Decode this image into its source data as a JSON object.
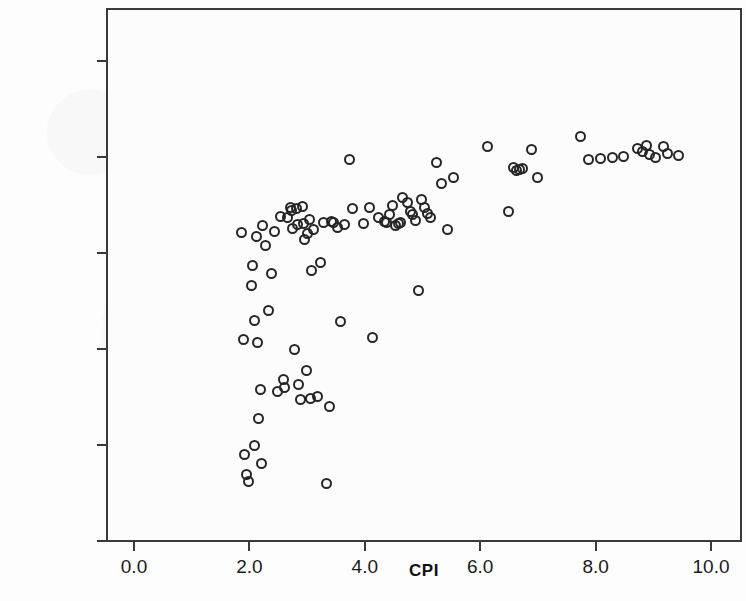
{
  "chart_data": {
    "type": "scatter",
    "title": "",
    "xlabel": "CPI",
    "ylabel": "Life expectancy at birth, total (years)",
    "xlim": [
      -0.5,
      10.7
    ],
    "ylim": [
      40.0,
      94.0
    ],
    "xticks": [
      "0.0",
      "2.0",
      "4.0",
      "6.0",
      "8.0",
      "10.0"
    ],
    "xtick_values": [
      0.0,
      2.0,
      4.0,
      6.0,
      8.0,
      10.0
    ],
    "yticks": [
      "40.00",
      "50.00",
      "60.00",
      "70.00",
      "80.00",
      "90.00"
    ],
    "ytick_values": [
      40.0,
      50.0,
      60.0,
      70.0,
      80.0,
      90.0
    ],
    "grid": false,
    "legend": null,
    "marker": "open-circle",
    "marker_color": "#262626",
    "marker_fill": "none",
    "points": [
      [
        1.82,
        72.3
      ],
      [
        1.86,
        61.2
      ],
      [
        1.88,
        49.2
      ],
      [
        1.92,
        47.1
      ],
      [
        1.95,
        46.4
      ],
      [
        2.0,
        66.8
      ],
      [
        2.02,
        68.9
      ],
      [
        2.05,
        63.2
      ],
      [
        2.06,
        50.2
      ],
      [
        2.08,
        71.9
      ],
      [
        2.1,
        60.9
      ],
      [
        2.12,
        53.0
      ],
      [
        2.15,
        56.0
      ],
      [
        2.18,
        48.3
      ],
      [
        2.2,
        73.1
      ],
      [
        2.25,
        71.0
      ],
      [
        2.3,
        64.2
      ],
      [
        2.35,
        68.1
      ],
      [
        2.4,
        72.4
      ],
      [
        2.45,
        55.8
      ],
      [
        2.5,
        74.0
      ],
      [
        2.55,
        57.0
      ],
      [
        2.58,
        56.2
      ],
      [
        2.62,
        73.9
      ],
      [
        2.68,
        75.0
      ],
      [
        2.7,
        74.6
      ],
      [
        2.72,
        72.8
      ],
      [
        2.75,
        60.2
      ],
      [
        2.78,
        74.8
      ],
      [
        2.8,
        73.2
      ],
      [
        2.82,
        56.5
      ],
      [
        2.85,
        54.9
      ],
      [
        2.88,
        75.1
      ],
      [
        2.9,
        73.3
      ],
      [
        2.92,
        71.6
      ],
      [
        2.95,
        58.0
      ],
      [
        2.98,
        72.2
      ],
      [
        3.0,
        73.7
      ],
      [
        3.02,
        55.1
      ],
      [
        3.05,
        68.4
      ],
      [
        3.08,
        72.7
      ],
      [
        3.15,
        55.3
      ],
      [
        3.2,
        69.2
      ],
      [
        3.25,
        73.4
      ],
      [
        3.3,
        46.2
      ],
      [
        3.35,
        54.2
      ],
      [
        3.38,
        73.5
      ],
      [
        3.42,
        73.4
      ],
      [
        3.5,
        72.9
      ],
      [
        3.55,
        63.1
      ],
      [
        3.62,
        73.2
      ],
      [
        3.7,
        80.0
      ],
      [
        3.75,
        74.8
      ],
      [
        3.95,
        73.3
      ],
      [
        4.05,
        75.0
      ],
      [
        4.1,
        61.4
      ],
      [
        4.2,
        73.9
      ],
      [
        4.3,
        73.5
      ],
      [
        4.35,
        73.4
      ],
      [
        4.4,
        74.2
      ],
      [
        4.45,
        75.2
      ],
      [
        4.5,
        73.1
      ],
      [
        4.55,
        73.3
      ],
      [
        4.58,
        73.4
      ],
      [
        4.62,
        76.0
      ],
      [
        4.7,
        75.5
      ],
      [
        4.75,
        74.5
      ],
      [
        4.8,
        74.2
      ],
      [
        4.85,
        73.6
      ],
      [
        4.9,
        66.3
      ],
      [
        4.95,
        75.8
      ],
      [
        5.0,
        74.9
      ],
      [
        5.05,
        74.3
      ],
      [
        5.1,
        73.9
      ],
      [
        5.2,
        79.6
      ],
      [
        5.3,
        77.4
      ],
      [
        5.4,
        72.7
      ],
      [
        5.5,
        78.1
      ],
      [
        6.1,
        81.3
      ],
      [
        6.45,
        74.5
      ],
      [
        6.55,
        79.1
      ],
      [
        6.6,
        78.8
      ],
      [
        6.65,
        78.9
      ],
      [
        6.7,
        79.0
      ],
      [
        6.85,
        81.0
      ],
      [
        6.95,
        78.1
      ],
      [
        7.7,
        82.3
      ],
      [
        7.85,
        80.0
      ],
      [
        8.05,
        80.1
      ],
      [
        8.25,
        80.2
      ],
      [
        8.45,
        80.3
      ],
      [
        8.7,
        81.1
      ],
      [
        8.78,
        80.8
      ],
      [
        8.85,
        81.4
      ],
      [
        8.9,
        80.5
      ],
      [
        9.0,
        80.2
      ],
      [
        9.15,
        81.3
      ],
      [
        9.22,
        80.6
      ],
      [
        9.4,
        80.4
      ]
    ],
    "n_points": 100
  },
  "axis": {
    "x_title": "CPI",
    "y_title": "Life expectancy at birth, total (years)"
  }
}
